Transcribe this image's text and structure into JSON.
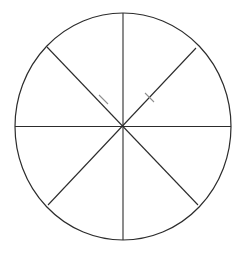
{
  "figure": {
    "canvas": {
      "width": 246,
      "height": 254,
      "background_color": "#ffffff"
    },
    "style": {
      "line_color": "#2c2c2c",
      "line_width": 1.1,
      "faint_line_color": "#8f8f8f",
      "fill": "none"
    },
    "circle": {
      "label": "circle-outline",
      "center_x": 123,
      "center_y": 126.5,
      "radius_x": 108,
      "radius_y": 113.5,
      "stroke_color": "#2c2c2c",
      "stroke_width": 1.2
    },
    "center_point": {
      "label": "center-vertex",
      "x": 123,
      "y": 126.5
    },
    "sector_count": 8,
    "sector_angle_degrees": 45,
    "dividers": [
      {
        "name": "vertical-diameter",
        "angle_degrees": 90,
        "x1": 123,
        "y1": 13,
        "x2": 123,
        "y2": 240
      },
      {
        "name": "horizontal-diameter",
        "angle_degrees": 0,
        "x1": 15,
        "y1": 126.5,
        "x2": 231,
        "y2": 126.5
      },
      {
        "name": "diagonal-diameter-nw-se",
        "angle_degrees": 135,
        "x1": 47,
        "y1": 47,
        "x2": 198,
        "y2": 205
      },
      {
        "name": "diagonal-diameter-ne-sw",
        "angle_degrees": 45,
        "x1": 196,
        "y1": 48,
        "x2": 48,
        "y2": 205
      }
    ],
    "faint_segments": [
      {
        "name": "faint-gap-upper-left-diagonal",
        "x1": 99,
        "y1": 95,
        "x2": 108,
        "y2": 104
      },
      {
        "name": "faint-gap-upper-right-diagonal",
        "x1": 145,
        "y1": 93,
        "x2": 154,
        "y2": 102
      }
    ],
    "chart_data": {
      "type": "pie",
      "title": "",
      "categories": [
        "1",
        "2",
        "3",
        "4",
        "5",
        "6",
        "7",
        "8"
      ],
      "values": [
        12.5,
        12.5,
        12.5,
        12.5,
        12.5,
        12.5,
        12.5,
        12.5
      ],
      "unit": "percent",
      "labels_shown": false,
      "legend": false,
      "legend_position": "none",
      "slice_fill": "none",
      "slice_stroke": "#2c2c2c"
    }
  }
}
